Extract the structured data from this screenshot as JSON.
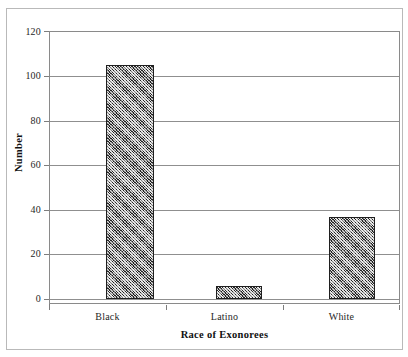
{
  "chart_data": {
    "type": "bar",
    "title": "",
    "xlabel": "Race of Exonorees",
    "ylabel": "Number",
    "categories": [
      "Black",
      "Latino",
      "White"
    ],
    "values": [
      105,
      6,
      37
    ],
    "ylim": [
      0,
      120
    ],
    "yticks": [
      0,
      20,
      40,
      60,
      80,
      100,
      120
    ],
    "ytick_labels": [
      "0",
      "20",
      "40",
      "60",
      "80",
      "100",
      "120"
    ],
    "grid": "horizontal",
    "legend": "none",
    "bar_fill": "diagonal-hatch",
    "colors": {
      "bar_fill": "#7d7d7d",
      "bar_edge": "#1f1f1f",
      "gridline": "#8f8f8f",
      "axis": "#7d7d7d",
      "frame": "#8a8a8a",
      "outer_border": "#b9b9b9",
      "text": "#262626"
    }
  }
}
